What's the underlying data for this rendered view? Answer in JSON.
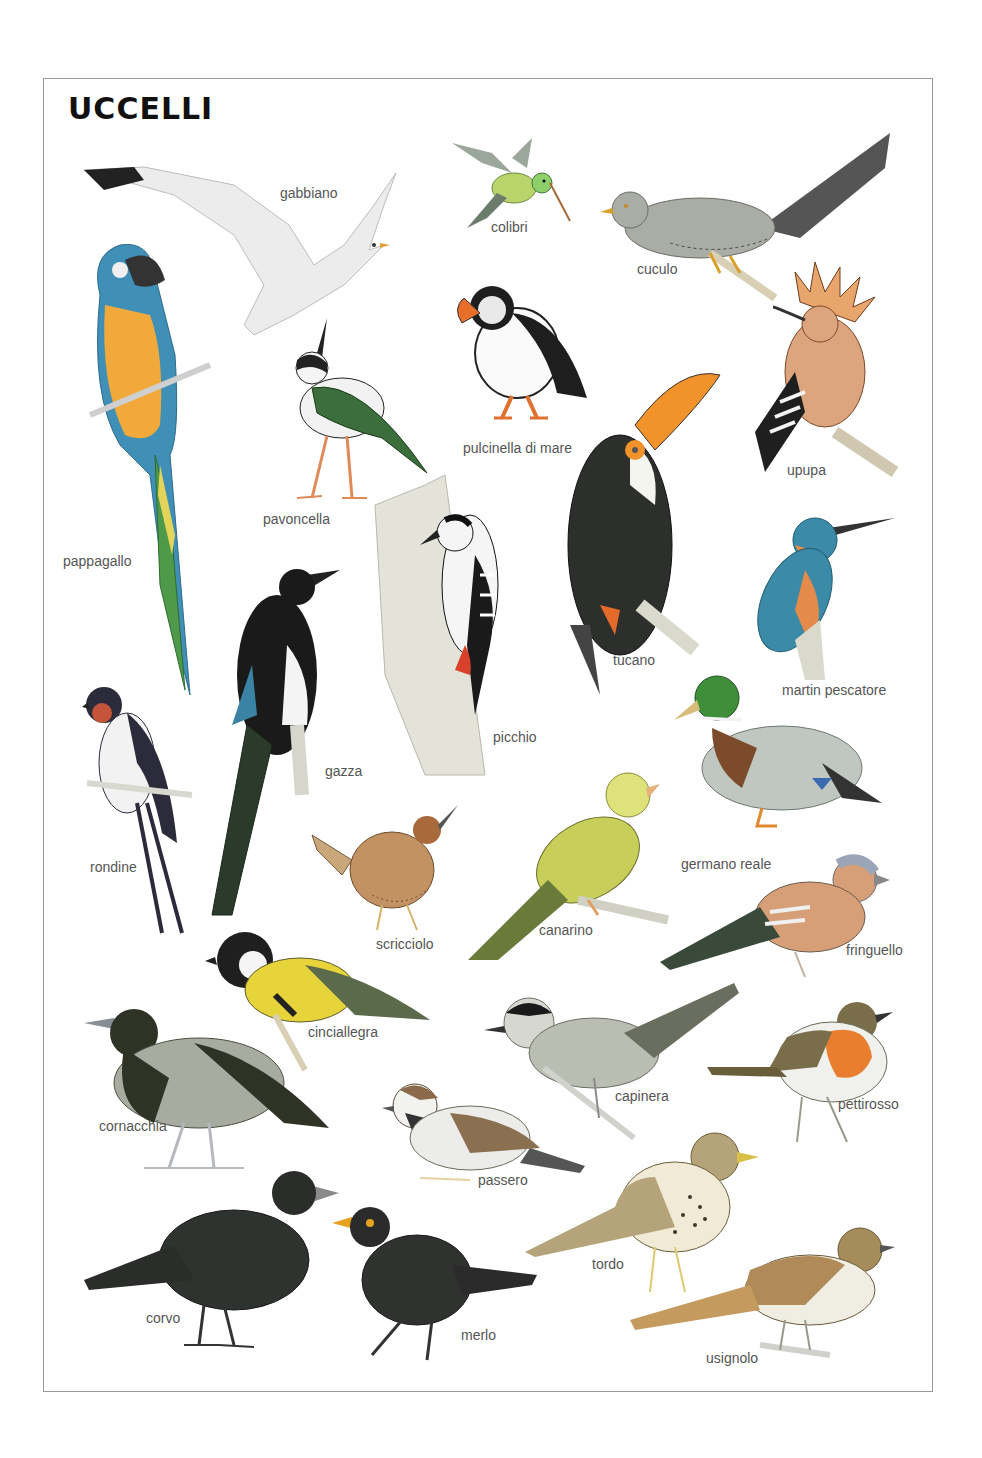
{
  "title": "UCCELLI",
  "colors": {
    "frame": "#9a9a9a",
    "label": "#555555",
    "title": "#111111"
  },
  "birds": [
    {
      "id": "gabbiano",
      "label": "gabbiano",
      "lx": 280,
      "ly": 186
    },
    {
      "id": "colibri",
      "label": "colibri",
      "lx": 491,
      "ly": 220
    },
    {
      "id": "cuculo",
      "label": "cuculo",
      "lx": 637,
      "ly": 262
    },
    {
      "id": "pappagallo",
      "label": "pappagallo",
      "lx": 63,
      "ly": 554
    },
    {
      "id": "pulcinella",
      "label": "pulcinella di mare",
      "lx": 463,
      "ly": 441
    },
    {
      "id": "upupa",
      "label": "upupa",
      "lx": 787,
      "ly": 463
    },
    {
      "id": "pavoncella",
      "label": "pavoncella",
      "lx": 263,
      "ly": 512
    },
    {
      "id": "martin",
      "label": "martin pescatore",
      "lx": 782,
      "ly": 683
    },
    {
      "id": "tucano",
      "label": "tucano",
      "lx": 613,
      "ly": 653
    },
    {
      "id": "picchio",
      "label": "picchio",
      "lx": 493,
      "ly": 730
    },
    {
      "id": "gazza",
      "label": "gazza",
      "lx": 325,
      "ly": 764
    },
    {
      "id": "rondine",
      "label": "rondine",
      "lx": 90,
      "ly": 860
    },
    {
      "id": "germano",
      "label": "germano reale",
      "lx": 681,
      "ly": 857
    },
    {
      "id": "scricciolo",
      "label": "scricciolo",
      "lx": 376,
      "ly": 937
    },
    {
      "id": "canarino",
      "label": "canarino",
      "lx": 539,
      "ly": 923
    },
    {
      "id": "fringuello",
      "label": "fringuello",
      "lx": 846,
      "ly": 943
    },
    {
      "id": "cinciallegra",
      "label": "cinciallegra",
      "lx": 308,
      "ly": 1025
    },
    {
      "id": "capinera",
      "label": "capinera",
      "lx": 615,
      "ly": 1089
    },
    {
      "id": "pettirosso",
      "label": "pettirosso",
      "lx": 838,
      "ly": 1097
    },
    {
      "id": "cornacchia",
      "label": "cornacchia",
      "lx": 99,
      "ly": 1119
    },
    {
      "id": "passero",
      "label": "passero",
      "lx": 478,
      "ly": 1173
    },
    {
      "id": "tordo",
      "label": "tordo",
      "lx": 592,
      "ly": 1257
    },
    {
      "id": "corvo",
      "label": "corvo",
      "lx": 146,
      "ly": 1311
    },
    {
      "id": "merlo",
      "label": "merlo",
      "lx": 461,
      "ly": 1328
    },
    {
      "id": "usignolo",
      "label": "usignolo",
      "lx": 706,
      "ly": 1351
    }
  ]
}
